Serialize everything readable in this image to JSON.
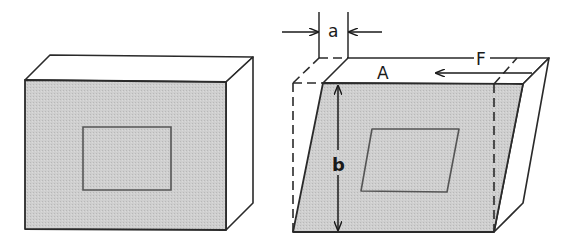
{
  "figure": {
    "colors": {
      "face_fill": "#c9c9c9",
      "stroke": "#2a2a2a",
      "background": "#ffffff"
    },
    "left_block": {
      "state": "undeformed",
      "inner_shape": "rectangle"
    },
    "right_block": {
      "state": "sheared",
      "inner_shape": "parallelogram",
      "labels": {
        "displacement": "a",
        "area": "A",
        "force": "F",
        "height": "b"
      }
    }
  }
}
